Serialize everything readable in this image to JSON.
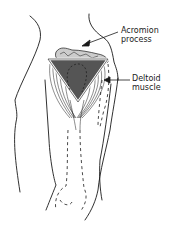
{
  "diagram": {
    "type": "anatomical-illustration",
    "colors": {
      "line": "#1a1a1a",
      "triangle_fill": "#555555",
      "triangle_outline": "#ffffff",
      "background": "#ffffff"
    },
    "labels": [
      {
        "id": "acromion",
        "line1": "Acromion",
        "line2": "process"
      },
      {
        "id": "deltoid",
        "line1": "Deltoid",
        "line2": "muscle"
      }
    ]
  }
}
